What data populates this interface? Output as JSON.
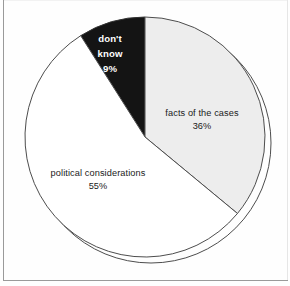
{
  "chart_data": {
    "type": "pie",
    "title": "",
    "subtitle": "",
    "xlabel": "",
    "ylabel": "",
    "legend_position": "inline-labels",
    "grid": false,
    "total_percent": 100,
    "start_angle_deg": -32.4,
    "direction": "clockwise",
    "categories": [
      "don't know",
      "facts of the cases",
      "political considerations"
    ],
    "values": [
      9,
      36,
      55
    ],
    "slices": [
      {
        "label": "don't know",
        "label_line_1": "don't",
        "label_line_2": "know",
        "value": 9,
        "value_label": "9%",
        "fill": "#141414",
        "text_color": "#ffffff",
        "stroke": "#333333",
        "start_deg": -32.4,
        "end_deg": 0,
        "label_x": 110,
        "label_y": 42,
        "bold": true
      },
      {
        "label": "facts of the cases",
        "label_line_1": "facts of the cases",
        "label_line_2": "",
        "value": 36,
        "value_label": "36%",
        "fill": "#ededed",
        "text_color": "#1a1a1a",
        "stroke": "#4d4d4d",
        "start_deg": 0,
        "end_deg": 129.6,
        "label_x": 202,
        "label_y": 116,
        "bold": false
      },
      {
        "label": "political considerations",
        "label_line_1": "political considerations",
        "label_line_2": "",
        "value": 55,
        "value_label": "55%",
        "fill": "#ffffff",
        "text_color": "#1a1a1a",
        "stroke": "#4d4d4d",
        "start_deg": 129.6,
        "end_deg": 327.6,
        "label_x": 98,
        "label_y": 176,
        "bold": false
      }
    ],
    "geometry": {
      "center_x": 145,
      "center_y": 137,
      "radius": 120,
      "shadow_offset_x": 6,
      "shadow_offset_y": 6
    },
    "colors": {
      "dont_know": "#141414",
      "facts_of_the_cases": "#ededed",
      "political_considerations": "#ffffff",
      "outline": "#4d4d4d",
      "frame": "#9a9a9a",
      "background": "#fefefe"
    }
  },
  "frame": {
    "name": "chart-border"
  }
}
